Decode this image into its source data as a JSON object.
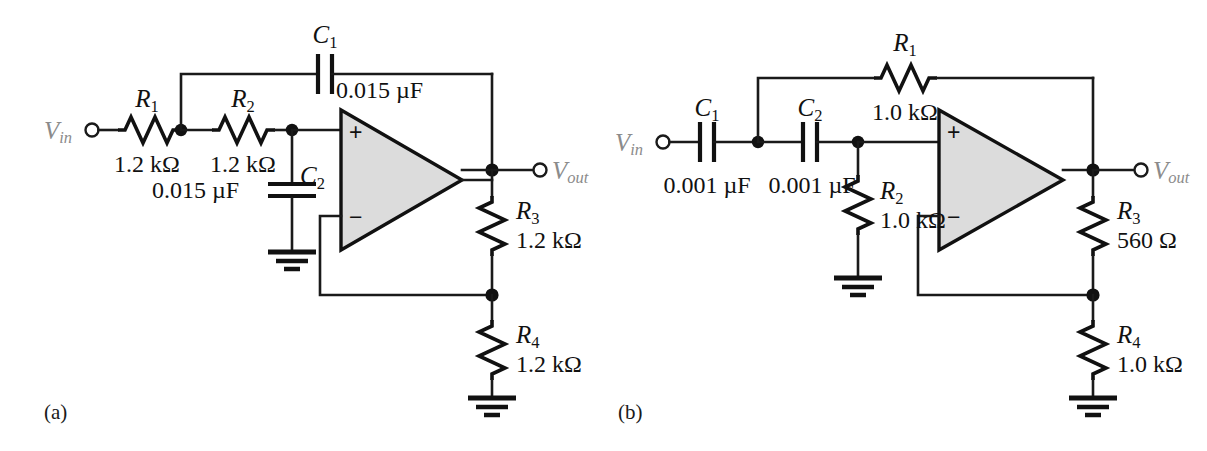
{
  "figure": {
    "background_color": "#ffffff",
    "wire_color": "#111111",
    "opamp_fill_color": "#dcdcdc",
    "port_label_color": "#8b8b8b"
  },
  "circuits": [
    {
      "caption": "(a)",
      "type": "Sallen-Key low-pass filter",
      "input_port": "V",
      "input_port_sub": "in",
      "output_port": "V",
      "output_port_sub": "out",
      "opamp": {
        "noninverting_sign": "+",
        "inverting_sign": "−"
      },
      "components": [
        {
          "ref": "R",
          "sub": "1",
          "value": "1.2 kΩ",
          "kind": "resistor",
          "orientation": "horizontal"
        },
        {
          "ref": "R",
          "sub": "2",
          "value": "1.2 kΩ",
          "kind": "resistor",
          "orientation": "horizontal"
        },
        {
          "ref": "C",
          "sub": "1",
          "value": "0.015 µF",
          "kind": "capacitor",
          "orientation": "horizontal"
        },
        {
          "ref": "C",
          "sub": "2",
          "value": "0.015 µF",
          "kind": "capacitor",
          "orientation": "vertical"
        },
        {
          "ref": "R",
          "sub": "3",
          "value": "1.2 kΩ",
          "kind": "resistor",
          "orientation": "vertical"
        },
        {
          "ref": "R",
          "sub": "4",
          "value": "1.2 kΩ",
          "kind": "resistor",
          "orientation": "vertical"
        }
      ],
      "labels": {
        "R1_ref": "R",
        "R1_sub": "1",
        "R1_val": "1.2 kΩ",
        "R2_ref": "R",
        "R2_sub": "2",
        "R2_val": "1.2 kΩ",
        "C1_ref": "C",
        "C1_sub": "1",
        "C1_val": "0.015 µF",
        "C2_ref": "C",
        "C2_sub": "2",
        "C2_val": "0.015 µF",
        "R3_ref": "R",
        "R3_sub": "3",
        "R3_val": "1.2 kΩ",
        "R4_ref": "R",
        "R4_sub": "4",
        "R4_val": "1.2 kΩ"
      }
    },
    {
      "caption": "(b)",
      "type": "Sallen-Key high-pass filter",
      "input_port": "V",
      "input_port_sub": "in",
      "output_port": "V",
      "output_port_sub": "out",
      "opamp": {
        "noninverting_sign": "+",
        "inverting_sign": "−"
      },
      "components": [
        {
          "ref": "C",
          "sub": "1",
          "value": "0.001 µF",
          "kind": "capacitor",
          "orientation": "horizontal"
        },
        {
          "ref": "C",
          "sub": "2",
          "value": "0.001 µF",
          "kind": "capacitor",
          "orientation": "horizontal"
        },
        {
          "ref": "R",
          "sub": "1",
          "value": "1.0 kΩ",
          "kind": "resistor",
          "orientation": "horizontal"
        },
        {
          "ref": "R",
          "sub": "2",
          "value": "1.0 kΩ",
          "kind": "resistor",
          "orientation": "vertical"
        },
        {
          "ref": "R",
          "sub": "3",
          "value": "560 Ω",
          "kind": "resistor",
          "orientation": "vertical"
        },
        {
          "ref": "R",
          "sub": "4",
          "value": "1.0 kΩ",
          "kind": "resistor",
          "orientation": "vertical"
        }
      ],
      "labels": {
        "C1_ref": "C",
        "C1_sub": "1",
        "C1_val": "0.001 µF",
        "C2_ref": "C",
        "C2_sub": "2",
        "C2_val": "0.001 µF",
        "R1_ref": "R",
        "R1_sub": "1",
        "R1_val": "1.0 kΩ",
        "R2_ref": "R",
        "R2_sub": "2",
        "R2_val": "1.0 kΩ",
        "R3_ref": "R",
        "R3_sub": "3",
        "R3_val": "560 Ω",
        "R4_ref": "R",
        "R4_sub": "4",
        "R4_val": "1.0 kΩ"
      }
    }
  ]
}
